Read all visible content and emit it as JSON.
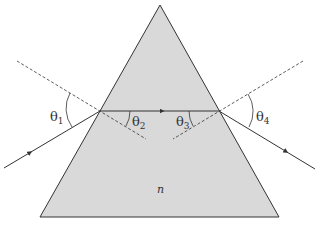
{
  "diagram": {
    "medium_label": "n",
    "angles": [
      {
        "symbol": "θ",
        "sub": "1"
      },
      {
        "symbol": "θ",
        "sub": "2"
      },
      {
        "symbol": "θ",
        "sub": "3"
      },
      {
        "symbol": "θ",
        "sub": "4"
      }
    ],
    "colors": {
      "prism_fill": "#d9d9d9",
      "line": "#333333"
    }
  }
}
